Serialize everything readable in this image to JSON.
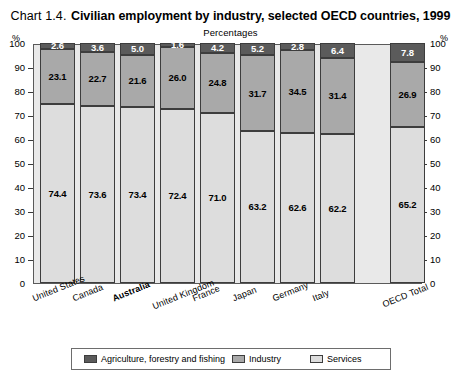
{
  "header": {
    "chart_number": "Chart 1.4.",
    "title": "Civilian employment by industry, selected OECD countries, 1999",
    "subtitle": "Percentages",
    "unit_left": "%",
    "unit_right": "%"
  },
  "chart_data": {
    "type": "bar",
    "subtype": "stacked-bar-100",
    "title": "Chart 1.4. Civilian employment by industry, selected OECD countries, 1999",
    "subtitle": "Percentages",
    "xlabel": "",
    "ylabel": "%",
    "ylim": [
      0,
      100
    ],
    "yticks": [
      0,
      10,
      20,
      30,
      40,
      50,
      60,
      70,
      80,
      90,
      100
    ],
    "grid": false,
    "legend_position": "bottom",
    "categories": [
      "United States",
      "Canada",
      "Australia",
      "United Kingdom",
      "France",
      "Japan",
      "Germany",
      "Italy",
      "OECD Total"
    ],
    "emphasis_category": "Australia",
    "series": [
      {
        "name": "Agriculture, forestry and fishing",
        "color": "#5b5b5b",
        "values": [
          2.6,
          3.6,
          5.0,
          1.6,
          4.2,
          5.2,
          2.8,
          6.4,
          7.8
        ]
      },
      {
        "name": "Industry",
        "color": "#a9a9a9",
        "values": [
          23.1,
          22.7,
          21.6,
          26.0,
          24.8,
          31.7,
          34.5,
          31.4,
          26.9
        ]
      },
      {
        "name": "Services",
        "color": "#dddddd",
        "values": [
          74.4,
          73.6,
          73.4,
          72.4,
          71.0,
          63.2,
          62.6,
          62.2,
          65.2
        ]
      }
    ]
  },
  "legend": {
    "items": [
      {
        "label": "Agriculture, forestry and fishing",
        "swatch": "#5b5b5b"
      },
      {
        "label": "Industry",
        "swatch": "#a9a9a9"
      },
      {
        "label": "Services",
        "swatch": "#dddddd"
      }
    ]
  }
}
